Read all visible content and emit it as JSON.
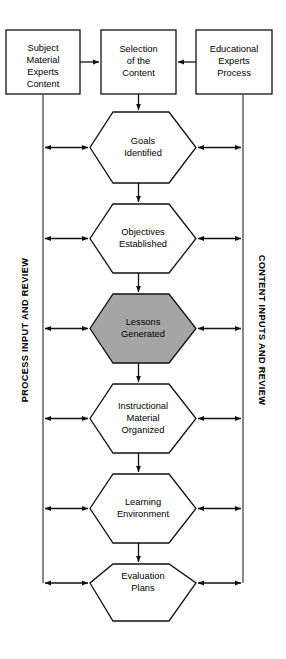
{
  "diagram": {
    "canvas": {
      "width": 286,
      "height": 659
    },
    "colors": {
      "stroke": "#111111",
      "rail_stroke": "#4a4a4a",
      "background": "#ffffff",
      "highlight_fill": "#a5a5a5",
      "node_fill": "#ffffff",
      "text": "#000000"
    },
    "top_boxes": [
      {
        "id": "subject-material-experts-content",
        "lines": [
          "Subject",
          "Material",
          "Experts",
          "Content"
        ]
      },
      {
        "id": "selection-of-the-content",
        "lines": [
          "Selection",
          "of the",
          "Content"
        ]
      },
      {
        "id": "educational-experts-process",
        "lines": [
          "Educational",
          "Experts",
          "Process"
        ]
      }
    ],
    "hexagons": [
      {
        "id": "goals-identified",
        "lines": [
          "Goals",
          "Identified"
        ],
        "highlighted": false
      },
      {
        "id": "objectives-established",
        "lines": [
          "Objectives",
          "Established"
        ],
        "highlighted": false
      },
      {
        "id": "lessons-generated",
        "lines": [
          "Lessons",
          "Generated"
        ],
        "highlighted": true
      },
      {
        "id": "instructional-material-organized",
        "lines": [
          "Instructional",
          "Material",
          "Organized"
        ],
        "highlighted": false
      },
      {
        "id": "learning-environment",
        "lines": [
          "Learning",
          "Environment"
        ],
        "highlighted": false
      },
      {
        "id": "evaluation-plans",
        "lines": [
          "Evaluation",
          "Plans"
        ],
        "highlighted": false
      }
    ],
    "rails": {
      "left": {
        "id": "process-input-and-review",
        "label": "PROCESS INPUT AND REVIEW"
      },
      "right": {
        "id": "content-inputs-and-review",
        "label": "CONTENT INPUTS AND REVIEW"
      }
    }
  }
}
